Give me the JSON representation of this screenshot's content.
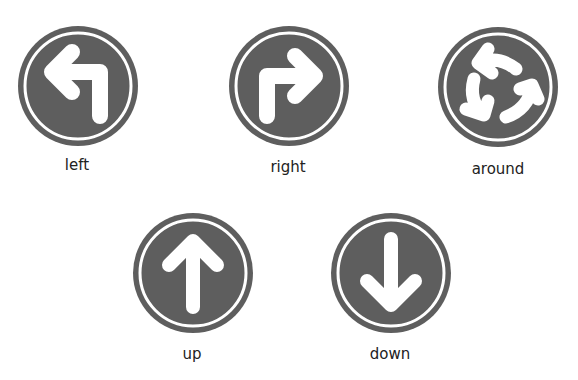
{
  "colors": {
    "sign_fill": "#5e5e5e",
    "arrow": "#ffffff",
    "label": "#222222"
  },
  "signs": [
    {
      "icon": "turn-left-arrow-icon",
      "label": "left"
    },
    {
      "icon": "turn-right-arrow-icon",
      "label": "right"
    },
    {
      "icon": "turn-around-arrows-icon",
      "label": "around"
    },
    {
      "icon": "up-arrow-icon",
      "label": "up"
    },
    {
      "icon": "down-arrow-icon",
      "label": "down"
    }
  ]
}
